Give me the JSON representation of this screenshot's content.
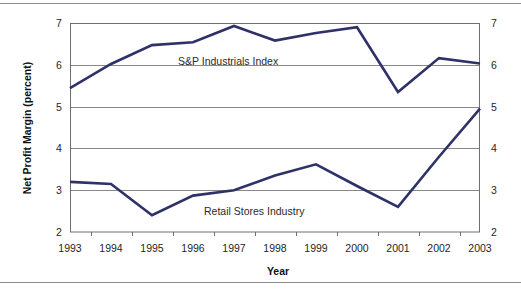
{
  "figure": {
    "background": "#ffffff",
    "rule_color": "#8d8d8d",
    "frame_color": "#6f6f6f",
    "grid_color": "#888888"
  },
  "chart_data": {
    "type": "line",
    "title": "",
    "xlabel": "Year",
    "ylabel": "Net Profit Margin (percent)",
    "categories": [
      "1993",
      "1994",
      "1995",
      "1996",
      "1997",
      "1998",
      "1999",
      "2000",
      "2001",
      "2002",
      "2003"
    ],
    "x": [
      1993,
      1994,
      1995,
      1996,
      1997,
      1998,
      1999,
      2000,
      2001,
      2002,
      2003
    ],
    "xlim": [
      1993,
      2003
    ],
    "ylim": [
      2,
      7
    ],
    "yticks": [
      2,
      3,
      4,
      5,
      6,
      7
    ],
    "ytick_labels": [
      "2",
      "3",
      "4",
      "5",
      "6",
      "7"
    ],
    "y_axis_right_labels": [
      "2",
      "3",
      "4",
      "5",
      "6",
      "7"
    ],
    "grid": "horizontal",
    "legend": "inline-labels",
    "series": [
      {
        "name": "S&P Industrials Index",
        "color": "#2e3268",
        "values": [
          5.44,
          6.02,
          6.47,
          6.54,
          6.93,
          6.58,
          6.76,
          6.9,
          5.35,
          6.16,
          6.03
        ],
        "label_position": {
          "x": 178,
          "y": 65
        }
      },
      {
        "name": "Retail Stores Industry",
        "color": "#2e3268",
        "values": [
          3.2,
          3.15,
          2.4,
          2.87,
          3.0,
          3.35,
          3.62,
          3.1,
          2.6,
          3.8,
          4.95
        ],
        "label_position": {
          "x": 204,
          "y": 215
        }
      }
    ],
    "annotations": [
      {
        "text": "S&P Industrials Index",
        "x": 178,
        "y": 65
      },
      {
        "text": "Retail Stores Industry",
        "x": 204,
        "y": 215
      }
    ],
    "plot_area": {
      "left": 70,
      "top": 23,
      "right": 480,
      "bottom": 232
    }
  }
}
